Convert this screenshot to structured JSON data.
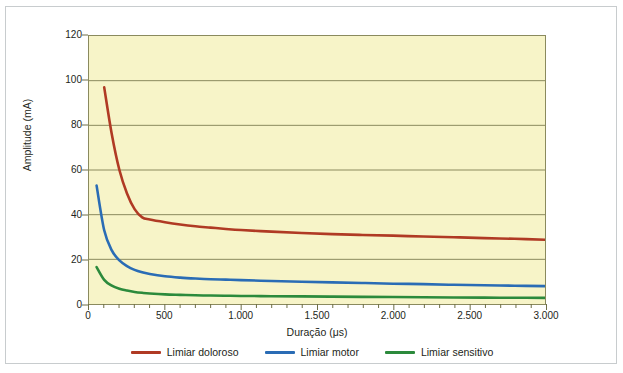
{
  "chart_data": {
    "type": "line",
    "title": "",
    "xlabel": "Duração (μs)",
    "ylabel": "Amplitude (mA)",
    "xlim": [
      0,
      3000
    ],
    "ylim": [
      0,
      120
    ],
    "grid": true,
    "legend_position": "bottom",
    "x_ticks": [
      0,
      500,
      1000,
      1500,
      2000,
      2500,
      3000
    ],
    "x_tick_labels": [
      "0",
      "500",
      "1.000",
      "1.500",
      "2.000",
      "2.500",
      "3.000"
    ],
    "x_minor_tick_step": 100,
    "y_ticks": [
      0,
      20,
      40,
      60,
      80,
      100,
      120
    ],
    "y_tick_labels": [
      "0",
      "20",
      "40",
      "60",
      "80",
      "100",
      "120"
    ],
    "x": [
      50,
      100,
      150,
      200,
      250,
      300,
      350,
      400,
      500,
      600,
      700,
      800,
      900,
      1000,
      1200,
      1400,
      1600,
      1800,
      2000,
      2200,
      2400,
      2600,
      2800,
      3000
    ],
    "series": [
      {
        "name": "Limiar doloroso",
        "color": "#b03a24",
        "values": [
          null,
          97.0,
          76.0,
          60.0,
          49.5,
          42.5,
          38.8,
          37.8,
          36.6,
          35.6,
          34.8,
          34.2,
          33.6,
          33.1,
          32.4,
          31.8,
          31.3,
          30.9,
          30.6,
          30.2,
          29.9,
          29.5,
          29.2,
          28.8
        ]
      },
      {
        "name": "Limiar motor",
        "color": "#2a6cb5",
        "values": [
          53.0,
          33.0,
          24.0,
          19.5,
          17.0,
          15.3,
          14.2,
          13.4,
          12.4,
          11.8,
          11.4,
          11.1,
          10.9,
          10.7,
          10.3,
          10.0,
          9.7,
          9.4,
          9.1,
          8.9,
          8.6,
          8.4,
          8.2,
          8.0
        ]
      },
      {
        "name": "Limiar sensitivo",
        "color": "#2c8a3c",
        "values": [
          16.5,
          10.8,
          8.2,
          6.8,
          6.0,
          5.4,
          5.0,
          4.7,
          4.3,
          4.1,
          3.9,
          3.8,
          3.7,
          3.6,
          3.5,
          3.4,
          3.3,
          3.2,
          3.1,
          3.0,
          2.9,
          2.85,
          2.8,
          2.75
        ]
      }
    ],
    "legend": [
      {
        "label": "Limiar doloroso",
        "color": "#b03a24"
      },
      {
        "label": "Limiar motor",
        "color": "#2a6cb5"
      },
      {
        "label": "Limiar sensitivo",
        "color": "#2c8a3c"
      }
    ],
    "colors": {
      "plot_background": "#f7f4c8",
      "figure_background": "#ffffff",
      "grid": "#8a8a5e",
      "axis": "#6e6e46",
      "text": "#231f20",
      "frame_border": "#c8ccce"
    }
  }
}
